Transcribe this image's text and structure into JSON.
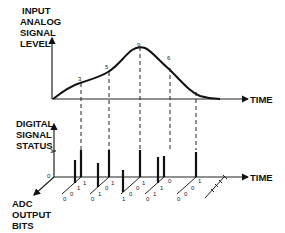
{
  "top_axis": {
    "ylabel_lines": [
      "INPUT",
      "ANALOG",
      "SIGNAL",
      "LEVEL"
    ],
    "xlabel": "TIME"
  },
  "bottom_axis": {
    "ylabel_lines": [
      "DIGITAL",
      "SIGNAL",
      "STATUS"
    ],
    "xlabel": "TIME",
    "zlabel_lines": [
      "ADC",
      "OUTPUT",
      "BITS"
    ],
    "tick_one": "1",
    "tick_zero": "0"
  },
  "samples": [
    {
      "value": "3",
      "bits": [
        "1",
        "1",
        "0",
        "0"
      ]
    },
    {
      "value": "5",
      "bits": [
        "1",
        "0",
        "1",
        "0"
      ]
    },
    {
      "value": "9",
      "bits": [
        "1",
        "0",
        "0",
        "1"
      ]
    },
    {
      "value": "6",
      "bits": [
        "0",
        "1",
        "1",
        "0"
      ]
    },
    {
      "value": "1",
      "bits": [
        "1",
        "0",
        "0",
        "0"
      ]
    },
    {
      "value": "0",
      "bits": [
        "0",
        "0",
        "0",
        "0"
      ]
    }
  ]
}
